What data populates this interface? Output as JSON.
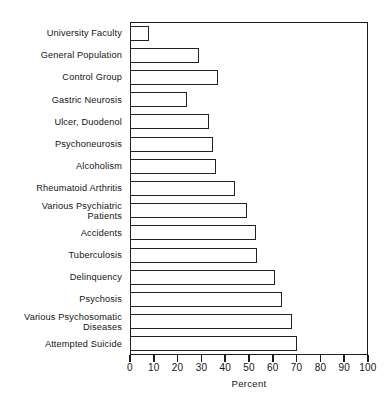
{
  "chart_data": {
    "type": "bar",
    "orientation": "horizontal",
    "title": "",
    "xlabel": "Percent",
    "ylabel": "",
    "xlim": [
      0,
      100
    ],
    "xticks": [
      0,
      10,
      20,
      30,
      40,
      50,
      60,
      70,
      80,
      90,
      100
    ],
    "xticklabels": [
      "0",
      "10",
      "20",
      "30",
      "40",
      "50",
      "60",
      "70",
      "80",
      "90",
      "100"
    ],
    "grid": false,
    "legend": false,
    "bar_facecolor": "#ffffff",
    "bar_edgecolor": "#222222",
    "categories": [
      "University Faculty",
      "General Population",
      "Control Group",
      "Gastric Neurosis",
      "Ulcer, Duodenol",
      "Psychoneurosis",
      "Alcoholism",
      "Rheumatoid Arthritis",
      "Various Psychiatric\nPatients",
      "Accidents",
      "Tuberculosis",
      "Delinquency",
      "Psychosis",
      "Various Psychosomatic\nDiseases",
      "Attempted Suicide"
    ],
    "values": [
      8,
      29,
      37,
      24,
      33,
      35,
      36,
      44,
      49,
      53,
      53.5,
      61,
      64,
      68,
      70
    ]
  }
}
